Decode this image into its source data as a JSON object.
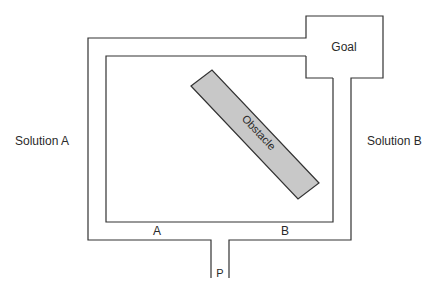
{
  "diagram": {
    "labels": {
      "solution_a": "Solution A",
      "solution_b": "Solution B",
      "goal": "Goal",
      "obstacle": "Obstacle",
      "path_a": "A",
      "path_b": "B",
      "start": "P"
    },
    "colors": {
      "wall": "#333333",
      "obstacle_fill": "#c8c8c8",
      "obstacle_stroke": "#333333",
      "text": "#2a2a2a",
      "background": "#ffffff"
    }
  }
}
